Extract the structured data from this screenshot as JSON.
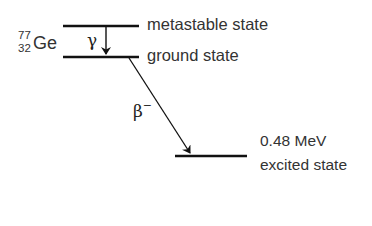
{
  "diagram": {
    "type": "nuclear-decay-energy-level-diagram",
    "nuclide": {
      "mass_number": "77",
      "atomic_number": "32",
      "symbol": "Ge"
    },
    "levels": [
      {
        "id": "metastable",
        "label": "metastable state"
      },
      {
        "id": "ground",
        "label": "ground state"
      },
      {
        "id": "excited",
        "energy": "0.48 MeV",
        "label": "excited state"
      }
    ],
    "transitions": [
      {
        "from": "metastable",
        "to": "ground",
        "label": "γ"
      },
      {
        "from": "ground",
        "to": "excited",
        "label": "β",
        "label_superscript": "−"
      }
    ],
    "colors": {
      "line": "#111111",
      "text": "#333333",
      "background": "#ffffff"
    }
  }
}
